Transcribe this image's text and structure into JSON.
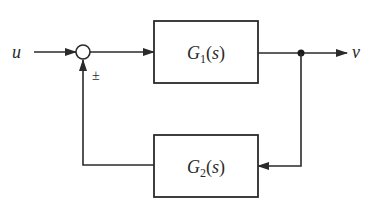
{
  "diagram": {
    "type": "feedback-block-diagram",
    "input_label": "u",
    "output_label": "v",
    "summing_sign": "±",
    "forward_block": {
      "name": "G",
      "sub": "1",
      "arg": "(s)"
    },
    "feedback_block": {
      "name": "G",
      "sub": "2",
      "arg": "(s)"
    },
    "colors": {
      "line": "#2a2a2a",
      "background": "#ffffff"
    }
  }
}
